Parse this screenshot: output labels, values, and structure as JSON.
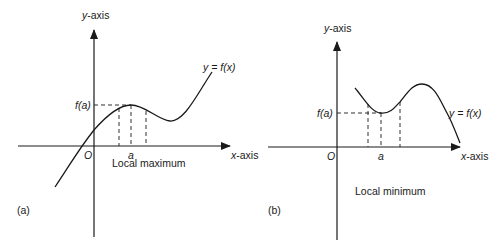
{
  "panels": [
    {
      "id": "a",
      "panel_label": "(a)",
      "caption": "Local maximum",
      "y_axis_label": "y-axis",
      "x_axis_label": "x-axis",
      "origin_label": "O",
      "point_label": "a",
      "value_label": "f(a)",
      "curve_label": "y = f(x)",
      "extremum": "maximum"
    },
    {
      "id": "b",
      "panel_label": "(b)",
      "caption": "Local minimum",
      "y_axis_label": "y-axis",
      "x_axis_label": "x-axis",
      "origin_label": "O",
      "point_label": "a",
      "value_label": "f(a)",
      "curve_label": "y = f(x)",
      "extremum": "minimum"
    }
  ],
  "colors": {
    "ink": "#1a1a1a",
    "background": "#ffffff"
  }
}
